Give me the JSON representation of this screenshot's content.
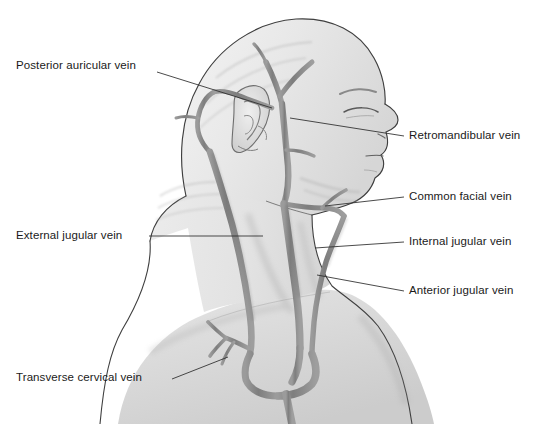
{
  "figure": {
    "background_color": "#ffffff",
    "line_color": "#3a3a3a",
    "vein_color": "#8a8a8a",
    "vein_color_dark": "#6f6f6f",
    "skin_color": "#e9e9e9",
    "text_color": "#1a1a1a"
  },
  "labels": {
    "posterior_auricular_vein": "Posterior auricular vein",
    "retromandibular_vein": "Retromandibular vein",
    "common_facial_vein": "Common facial vein",
    "external_jugular_vein": "External jugular vein",
    "internal_jugular_vein": "Internal jugular vein",
    "anterior_jugular_vein": "Anterior jugular vein",
    "transverse_cervical_vein": "Transverse cervical vein"
  },
  "annotations": [
    {
      "id": "posterior-auricular-vein",
      "text": "Posterior auricular vein",
      "side": "left",
      "text_x": 16,
      "text_y": 60,
      "leader": [
        [
          157,
          72
        ],
        [
          272,
          108
        ]
      ]
    },
    {
      "id": "retromandibular-vein",
      "text": "Retromandibular vein",
      "side": "right",
      "text_x": 409,
      "text_y": 130,
      "leader": [
        [
          404,
          136
        ],
        [
          290,
          118
        ]
      ]
    },
    {
      "id": "common-facial-vein",
      "text": "Common facial vein",
      "side": "right",
      "text_x": 409,
      "text_y": 191,
      "leader": [
        [
          404,
          197
        ],
        [
          325,
          206
        ]
      ]
    },
    {
      "id": "external-jugular-vein",
      "text": "External jugular vein",
      "side": "left",
      "text_x": 16,
      "text_y": 230,
      "leader": [
        [
          149,
          236
        ],
        [
          263,
          236
        ]
      ]
    },
    {
      "id": "internal-jugular-vein",
      "text": "Internal jugular vein",
      "side": "right",
      "text_x": 409,
      "text_y": 236,
      "leader": [
        [
          404,
          242
        ],
        [
          315,
          248
        ]
      ]
    },
    {
      "id": "anterior-jugular-vein",
      "text": "Anterior jugular vein",
      "side": "right",
      "text_x": 409,
      "text_y": 285,
      "leader": [
        [
          404,
          291
        ],
        [
          317,
          275
        ]
      ]
    },
    {
      "id": "transverse-cervical-vein",
      "text": "Transverse cervical vein",
      "side": "left",
      "text_x": 16,
      "text_y": 378,
      "leader": [
        [
          172,
          379
        ],
        [
          228,
          357
        ]
      ]
    }
  ]
}
